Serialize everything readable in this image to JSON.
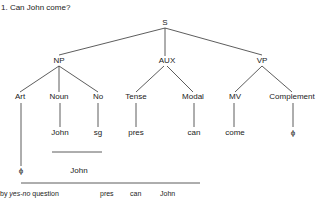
{
  "title": "1. Can John come?",
  "tree": {
    "root": "S",
    "level1": [
      "NP",
      "AUX",
      "VP"
    ],
    "level2": [
      "Art",
      "Noun",
      "No",
      "Tense",
      "Modal",
      "MV",
      "Complement"
    ],
    "level3": [
      "John",
      "sg",
      "pres",
      "can",
      "come",
      "ϕ"
    ],
    "art_leaf": "ϕ",
    "merged_label": "John"
  },
  "bottom": {
    "prefix": "by ",
    "rule": "yes-no",
    "suffix": " question",
    "items": [
      "pres",
      "can",
      "John"
    ]
  }
}
